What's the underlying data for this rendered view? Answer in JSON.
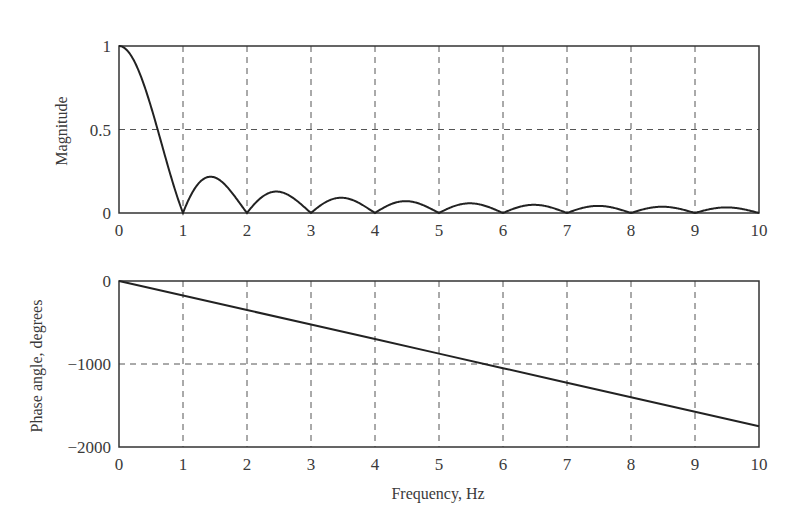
{
  "chart_data": [
    {
      "type": "line",
      "title": "",
      "xlabel": "",
      "ylabel": "Magnitude",
      "xlim": [
        0,
        10
      ],
      "ylim": [
        0,
        1
      ],
      "xticks": [
        "0",
        "1",
        "2",
        "3",
        "4",
        "5",
        "6",
        "7",
        "8",
        "9",
        "10"
      ],
      "yticks": [
        "0",
        "0.5",
        "1"
      ],
      "grid": true,
      "series": [
        {
          "name": "Magnitude",
          "x": [
            0,
            0.25,
            0.5,
            0.75,
            1,
            1.25,
            1.43,
            1.75,
            2,
            2.25,
            2.46,
            2.75,
            3,
            3.25,
            3.47,
            3.75,
            4,
            4.25,
            4.48,
            4.75,
            5,
            5.25,
            5.48,
            5.75,
            6,
            6.25,
            6.49,
            6.75,
            7,
            7.25,
            7.49,
            7.75,
            8,
            8.25,
            8.49,
            8.75,
            9,
            9.25,
            9.49,
            9.75,
            10
          ],
          "values": [
            1,
            0.9,
            0.637,
            0.3,
            0,
            0.18,
            0.217,
            0.129,
            0,
            0.1,
            0.128,
            0.082,
            0,
            0.069,
            0.091,
            0.06,
            0,
            0.053,
            0.071,
            0.047,
            0,
            0.043,
            0.058,
            0.039,
            0,
            0.036,
            0.049,
            0.033,
            0,
            0.031,
            0.042,
            0.029,
            0,
            0.027,
            0.037,
            0.026,
            0,
            0.024,
            0.033,
            0.023,
            0
          ]
        }
      ]
    },
    {
      "type": "line",
      "title": "",
      "xlabel": "Frequency, Hz",
      "ylabel": "Phase angle, degrees",
      "xlim": [
        0,
        10
      ],
      "ylim": [
        -2000,
        0
      ],
      "xticks": [
        "0",
        "1",
        "2",
        "3",
        "4",
        "5",
        "6",
        "7",
        "8",
        "9",
        "10"
      ],
      "yticks": [
        "-2000",
        "-1000",
        "0"
      ],
      "grid": true,
      "series": [
        {
          "name": "Phase",
          "x": [
            0,
            1,
            2,
            3,
            4,
            5,
            6,
            7,
            8,
            9,
            10
          ],
          "values": [
            0,
            -175,
            -350,
            -525,
            -700,
            -875,
            -1050,
            -1225,
            -1400,
            -1575,
            -1750
          ]
        }
      ]
    }
  ],
  "labels": {
    "top_ylabel": "Magnitude",
    "bottom_ylabel": "Phase angle, degrees",
    "xlabel": "Frequency, Hz"
  }
}
